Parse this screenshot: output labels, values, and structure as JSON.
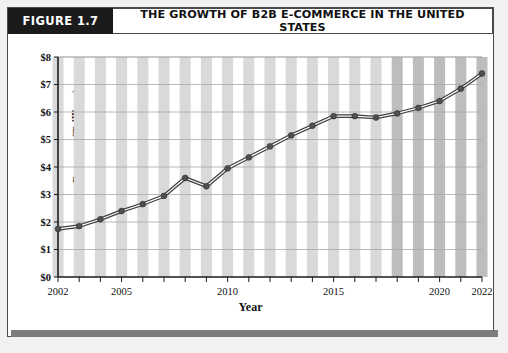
{
  "figure": {
    "tag": "FIGURE 1.7",
    "title": "THE GROWTH OF B2B E-COMMERCE IN THE UNITED STATES"
  },
  "colors": {
    "tag_background": "#1b1b1b",
    "tag_text": "#ffffff",
    "card_border": "#4a4a4a",
    "bar_actual": "#d9d9d9",
    "bar_projected": "#bdbdbd",
    "line": "#3f3f3f",
    "marker": "#4f4f4f",
    "gridline": "#a8a8a8",
    "axis": "#1b1b1b",
    "page_background": "#f2f1ef"
  },
  "chart_data": {
    "type": "line",
    "title": "THE GROWTH OF B2B E-COMMERCE IN THE UNITED STATES",
    "xlabel": "Year",
    "ylabel": "Revenue (Trillions)",
    "x": [
      2002,
      2003,
      2004,
      2005,
      2006,
      2007,
      2008,
      2009,
      2010,
      2011,
      2012,
      2013,
      2014,
      2015,
      2016,
      2017,
      2018,
      2019,
      2020,
      2021,
      2022
    ],
    "values": [
      1.75,
      1.85,
      2.1,
      2.4,
      2.65,
      2.95,
      3.6,
      3.3,
      3.95,
      4.35,
      4.75,
      5.15,
      5.5,
      5.85,
      5.85,
      5.8,
      5.95,
      6.15,
      6.4,
      6.85,
      7.4
    ],
    "ylim": [
      0,
      8
    ],
    "xlim": [
      2002,
      2022
    ],
    "ytick_labels": [
      "$0",
      "$1",
      "$2",
      "$3",
      "$4",
      "$5",
      "$6",
      "$7",
      "$8"
    ],
    "ytick_values": [
      0,
      1,
      2,
      3,
      4,
      5,
      6,
      7,
      8
    ],
    "xtick_labels": [
      "2002",
      "2005",
      "2010",
      "2015",
      "2020",
      "2022"
    ],
    "xtick_values": [
      2002,
      2005,
      2010,
      2015,
      2020,
      2022
    ],
    "grid": true,
    "legend": "none",
    "bars": {
      "shown": true,
      "projected_from": 2018
    }
  }
}
